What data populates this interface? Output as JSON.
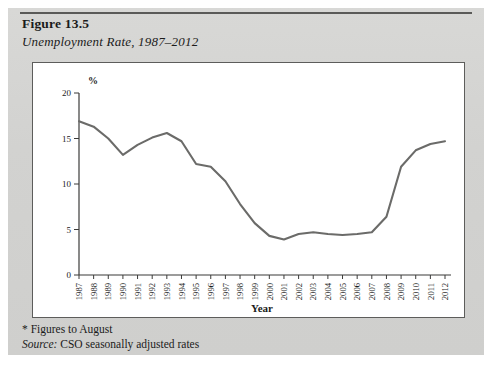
{
  "figure": {
    "title": "Figure 13.5",
    "subtitle": "Unemployment Rate, 1987–2012",
    "footnote": "* Figures to August",
    "source_word": "Source:",
    "source_text": " CSO seasonally adjusted rates"
  },
  "chart_data": {
    "type": "line",
    "title": "Unemployment Rate, 1987–2012",
    "xlabel": "Year",
    "ylabel": "%",
    "ylim": [
      0,
      20
    ],
    "yticks": [
      0,
      5,
      10,
      15,
      20
    ],
    "grid": false,
    "legend": "none",
    "line_color": "#6b6b69",
    "categories": [
      "1987",
      "1988",
      "1989",
      "1990",
      "1991",
      "1992",
      "1993",
      "1994",
      "1995",
      "1996",
      "1997",
      "1998",
      "1999",
      "2000",
      "2001",
      "2002",
      "2003",
      "2004",
      "2005",
      "2006",
      "2007",
      "2008",
      "2009",
      "2010",
      "2011",
      "2012"
    ],
    "values": [
      16.9,
      16.3,
      15.0,
      13.2,
      14.3,
      15.1,
      15.6,
      14.7,
      12.2,
      11.9,
      10.3,
      7.8,
      5.7,
      4.3,
      3.9,
      4.5,
      4.7,
      4.5,
      4.4,
      4.5,
      4.7,
      6.4,
      11.9,
      13.7,
      14.4,
      14.7
    ],
    "series": [
      {
        "name": "Unemployment Rate",
        "values": [
          16.9,
          16.3,
          15.0,
          13.2,
          14.3,
          15.1,
          15.6,
          14.7,
          12.2,
          11.9,
          10.3,
          7.8,
          5.7,
          4.3,
          3.9,
          4.5,
          4.7,
          4.5,
          4.4,
          4.5,
          4.7,
          6.4,
          11.9,
          13.7,
          14.4,
          14.7
        ]
      }
    ]
  }
}
